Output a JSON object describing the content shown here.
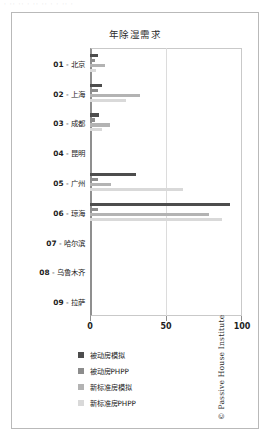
{
  "top_sliver_text": "· ·· ·· · ·· ·· · · ·· ·",
  "figure": {
    "copyright": "© Passive House Institute"
  },
  "chart_data": {
    "type": "bar",
    "orientation": "horizontal",
    "title": "年除湿需求",
    "xlabel": "",
    "ylabel": "",
    "xlim": [
      0,
      100
    ],
    "xticks": [
      0,
      50,
      100
    ],
    "xtick_labels": [
      "0",
      "50",
      "100"
    ],
    "grid": true,
    "legend_position": "bottom-left",
    "categories": [
      "01 - 北京",
      "02 - 上海",
      "03 - 成都",
      "04 - 昆明",
      "05 - 广州",
      "06 - 琼海",
      "07 - 哈尔滨",
      "08 - 乌鲁木齐",
      "09 - 拉萨"
    ],
    "series": [
      {
        "name": "被动房模拟",
        "color": "#4d4d4d",
        "values": [
          5,
          8,
          6,
          0,
          30,
          92,
          0,
          0,
          0
        ]
      },
      {
        "name": "被动房PHPP",
        "color": "#8c8c8c",
        "values": [
          3,
          5,
          3,
          0,
          5,
          5,
          0,
          0,
          0
        ]
      },
      {
        "name": "新标准房模拟",
        "color": "#b3b3b3",
        "values": [
          10,
          33,
          13,
          0,
          14,
          78,
          0,
          0,
          0
        ]
      },
      {
        "name": "新标准房PHPP",
        "color": "#d9d9d9",
        "values": [
          4,
          24,
          8,
          0,
          61,
          87,
          0,
          0,
          0
        ]
      }
    ]
  }
}
